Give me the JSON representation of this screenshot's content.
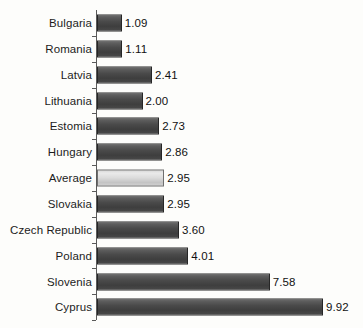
{
  "chart_data": {
    "type": "bar",
    "orientation": "horizontal",
    "title": "",
    "subtitle": "",
    "xlabel": "",
    "ylabel": "",
    "grid": false,
    "legend": "none",
    "xlim": [
      0,
      9.92
    ],
    "categories": [
      "Bulgaria",
      "Romania",
      "Latvia",
      "Lithuania",
      "Estomia",
      "Hungary",
      "Average",
      "Slovakia",
      "Czech Republic",
      "Poland",
      "Slovenia",
      "Cyprus"
    ],
    "values": [
      1.09,
      1.11,
      2.41,
      2.0,
      2.73,
      2.86,
      2.95,
      2.95,
      3.6,
      4.01,
      7.58,
      9.92
    ],
    "value_labels": [
      "1.09",
      "1.11",
      "2.41",
      "2.00",
      "2.73",
      "2.86",
      "2.95",
      "2.95",
      "3.60",
      "4.01",
      "7.58",
      "9.92"
    ],
    "highlighted_category": "Average",
    "colors": {
      "bar": "#4a4a4a",
      "bar_highlight": "#dcdcdc",
      "bar_outline": "#262626",
      "bar_highlight_outline": "#6f6f6f",
      "axis": "#5a5a5a",
      "text": "#1c1c1c",
      "background": "#fdfdfb"
    }
  }
}
